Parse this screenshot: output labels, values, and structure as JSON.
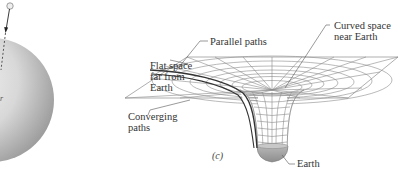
{
  "figure": {
    "panel_b": {
      "description": "Earth sphere with falling object path"
    },
    "panel_c": {
      "panel_label": "(c)",
      "labels": {
        "flat_space": [
          "Flat space",
          "far from",
          "Earth"
        ],
        "converging_paths": [
          "Converging",
          "paths"
        ],
        "parallel_paths": "Parallel paths",
        "curved_space": [
          "Curved space",
          "near Earth"
        ],
        "earth": "Earth"
      }
    },
    "colors": {
      "sphere_light": "#e6e6e6",
      "sphere_dark": "#9a9a9a",
      "grid_line": "#8c8c8c",
      "path_line": "#333333",
      "earth_fill": "#a0a0a0",
      "text": "#333333"
    }
  }
}
